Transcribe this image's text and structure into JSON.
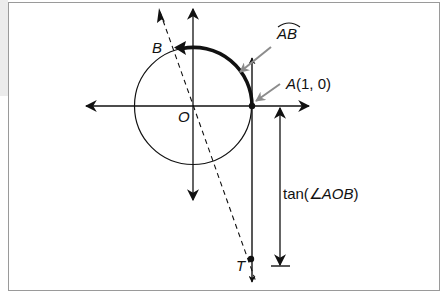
{
  "diagram": {
    "labels": {
      "origin": "O",
      "point_b": "B",
      "point_a": "A(1, 0)",
      "point_a_letter": "A",
      "point_a_coords": "(1, 0)",
      "arc": "AB",
      "point_t": "T",
      "tangent_measure": "tan(∠AOB)",
      "tangent_measure_prefix": "tan(∠",
      "tangent_measure_angle": "AOB",
      "tangent_measure_suffix": ")"
    },
    "colors": {
      "stroke": "#111111",
      "pointer_arrow": "#8c8c8c",
      "frame": "#9a9a9a",
      "left_shade": "#ececec"
    },
    "geometry": {
      "origin": [
        193,
        106
      ],
      "radius": 59,
      "point_a": [
        252,
        106
      ],
      "point_b": [
        175,
        48
      ],
      "point_t": [
        251,
        259
      ]
    }
  }
}
